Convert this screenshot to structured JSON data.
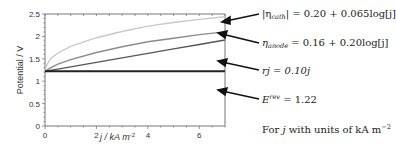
{
  "chart_data": {
    "type": "line",
    "title": "",
    "xlabel": "j / kA m-2",
    "ylabel": "Potential / V",
    "xlim": [
      0,
      7
    ],
    "ylim": [
      0,
      2.5
    ],
    "x_ticks": [
      "0",
      "2",
      "4",
      "6"
    ],
    "y_ticks": [
      "0",
      "0.5",
      "1",
      "1.5",
      "2",
      "2.5"
    ],
    "grid": false,
    "legend": "none (arrow annotations on right)",
    "x": [
      0,
      0.05,
      0.1,
      0.25,
      0.5,
      1,
      2,
      3,
      4,
      5,
      6,
      7
    ],
    "series": [
      {
        "name": "E_rev + rj + eta_anode + |eta_cath|",
        "color": "#c8c8c8",
        "values": [
          1.22,
          1.33,
          1.4,
          1.52,
          1.63,
          1.78,
          1.97,
          2.11,
          2.23,
          2.31,
          2.38,
          2.44
        ]
      },
      {
        "name": "E_rev + rj + eta_anode",
        "color": "#8a8a8a",
        "values": [
          1.22,
          1.23,
          1.26,
          1.31,
          1.38,
          1.48,
          1.64,
          1.77,
          1.88,
          1.96,
          2.04,
          2.1
        ]
      },
      {
        "name": "E_rev + rj",
        "color": "#555555",
        "values": [
          1.22,
          1.225,
          1.23,
          1.245,
          1.27,
          1.32,
          1.42,
          1.52,
          1.62,
          1.72,
          1.82,
          1.92
        ]
      },
      {
        "name": "E_rev",
        "color": "#222222",
        "values": [
          1.22,
          1.22,
          1.22,
          1.22,
          1.22,
          1.22,
          1.22,
          1.22,
          1.22,
          1.22,
          1.22,
          1.22
        ]
      }
    ],
    "annotations": [
      {
        "text": "|η_cath| = 0.20 + 0.065log[j]",
        "points_to": "top curve"
      },
      {
        "text": "η_anode = 0.16 + 0.20log[j]",
        "points_to": "second curve"
      },
      {
        "text": "rj = 0.10j",
        "points_to": "third curve"
      },
      {
        "text": "E^rev = 1.22",
        "points_to": "flat line"
      },
      {
        "text": "For j with units of kA m^-2",
        "points_to": null
      }
    ]
  },
  "labels": {
    "ylabel": "Potential / V",
    "xlabel": "j / kA m",
    "xlabel_sup": "-2",
    "x_tick_0": "0",
    "x_tick_2": "2",
    "x_tick_4": "4",
    "x_tick_6": "6",
    "y_tick_0": "0",
    "y_tick_05": "0.5",
    "y_tick_1": "1",
    "y_tick_15": "1.5",
    "y_tick_2": "2",
    "y_tick_25": "2.5"
  },
  "annotations": {
    "cath_lhs": "|η",
    "cath_sub": "cath",
    "cath_rhs": "| = 0.20 + 0.065log[j]",
    "anode_lhs": "η",
    "anode_sub": "anode",
    "anode_rhs": " = 0.16 + 0.20log[j]",
    "ohmic": "rj = 0.10j",
    "erev_lhs": "E",
    "erev_sup": "rev",
    "erev_rhs": " = 1.22",
    "note_pre": "For ",
    "note_j": "j",
    "note_post": " with units of kA m",
    "note_sup": "−2"
  }
}
